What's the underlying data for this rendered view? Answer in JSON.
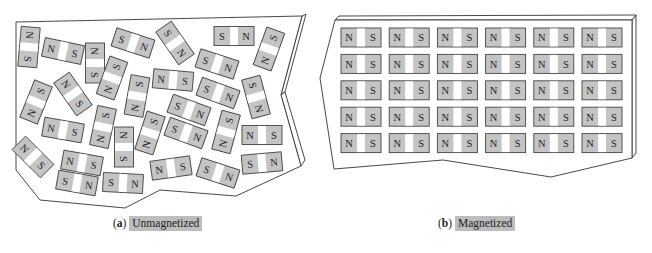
{
  "figure": {
    "panels": [
      {
        "id": "a",
        "tag": "a",
        "caption": "Unmagnetized",
        "magnets": [
          {
            "x": 29,
            "y": 47,
            "a": 95,
            "l": "N",
            "r": "S"
          },
          {
            "x": 63,
            "y": 51,
            "a": 12,
            "l": "N",
            "r": "S"
          },
          {
            "x": 95,
            "y": 63,
            "a": 90,
            "l": "N",
            "r": "S"
          },
          {
            "x": 133,
            "y": 43,
            "a": 18,
            "l": "S",
            "r": "N"
          },
          {
            "x": 175,
            "y": 43,
            "a": 55,
            "l": "S",
            "r": "N"
          },
          {
            "x": 234,
            "y": 36,
            "a": 0,
            "l": "S",
            "r": "N"
          },
          {
            "x": 269,
            "y": 49,
            "a": -70,
            "l": "N",
            "r": "S"
          },
          {
            "x": 217,
            "y": 64,
            "a": 18,
            "l": "S",
            "r": "N"
          },
          {
            "x": 36,
            "y": 102,
            "a": -68,
            "l": "N",
            "r": "S"
          },
          {
            "x": 73,
            "y": 94,
            "a": 55,
            "l": "N",
            "r": "S"
          },
          {
            "x": 112,
            "y": 78,
            "a": -70,
            "l": "N",
            "r": "S"
          },
          {
            "x": 137,
            "y": 96,
            "a": -80,
            "l": "N",
            "r": "S"
          },
          {
            "x": 173,
            "y": 80,
            "a": 5,
            "l": "N",
            "r": "S"
          },
          {
            "x": 218,
            "y": 93,
            "a": 20,
            "l": "S",
            "r": "N"
          },
          {
            "x": 256,
            "y": 97,
            "a": 75,
            "l": "S",
            "r": "N"
          },
          {
            "x": 189,
            "y": 110,
            "a": 20,
            "l": "S",
            "r": "N"
          },
          {
            "x": 63,
            "y": 130,
            "a": 10,
            "l": "N",
            "r": "S"
          },
          {
            "x": 103,
            "y": 127,
            "a": -78,
            "l": "N",
            "r": "S"
          },
          {
            "x": 150,
            "y": 133,
            "a": -72,
            "l": "N",
            "r": "S"
          },
          {
            "x": 124,
            "y": 147,
            "a": 90,
            "l": "N",
            "r": "S"
          },
          {
            "x": 186,
            "y": 133,
            "a": 20,
            "l": "S",
            "r": "N"
          },
          {
            "x": 226,
            "y": 132,
            "a": -75,
            "l": "N",
            "r": "S"
          },
          {
            "x": 262,
            "y": 135,
            "a": 0,
            "l": "N",
            "r": "S"
          },
          {
            "x": 33,
            "y": 157,
            "a": 45,
            "l": "N",
            "r": "S"
          },
          {
            "x": 82,
            "y": 163,
            "a": 10,
            "l": "N",
            "r": "S"
          },
          {
            "x": 171,
            "y": 168,
            "a": -8,
            "l": "N",
            "r": "S"
          },
          {
            "x": 218,
            "y": 173,
            "a": 18,
            "l": "S",
            "r": "N"
          },
          {
            "x": 262,
            "y": 163,
            "a": -5,
            "l": "S",
            "r": "N"
          },
          {
            "x": 77,
            "y": 183,
            "a": 10,
            "l": "S",
            "r": "N"
          },
          {
            "x": 123,
            "y": 183,
            "a": 3,
            "l": "S",
            "r": "N"
          }
        ]
      },
      {
        "id": "b",
        "tag": "b",
        "caption": "Magnetized",
        "grid": {
          "rows": 5,
          "cols": 6,
          "left_label": "N",
          "right_label": "S",
          "origin_x": 341,
          "origin_y": 28,
          "col_step": 48.2,
          "row_step": 26.4,
          "width": 40,
          "height": 19
        }
      }
    ],
    "colors": {
      "magnet_fill": "#c4c4c4",
      "magnet_stroke": "#444444",
      "caption_highlight": "#bdbdbd",
      "outline": "#333333"
    }
  }
}
